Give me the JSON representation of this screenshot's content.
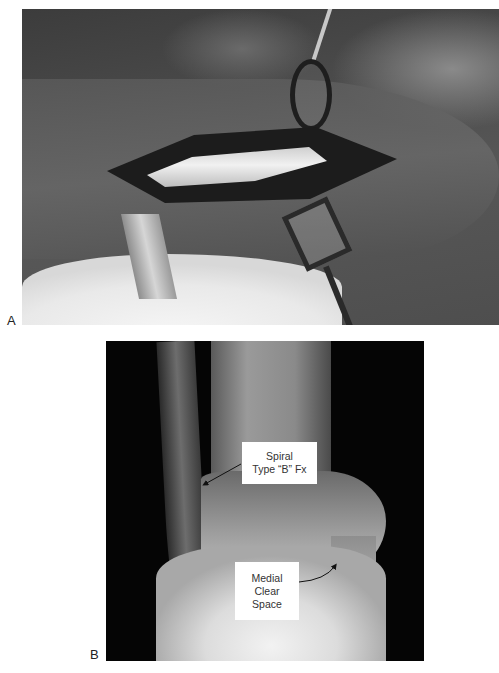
{
  "figure": {
    "panels": [
      {
        "id": "A",
        "label": "A",
        "type": "intraoperative-photograph",
        "description": "Surgical exposure of lateral ankle with retractors"
      },
      {
        "id": "B",
        "label": "B",
        "type": "radiograph",
        "description": "AP ankle radiograph",
        "annotations": [
          {
            "id": "spiral",
            "lines": [
              "Spiral",
              "Type “B” Fx"
            ]
          },
          {
            "id": "medial",
            "lines": [
              "Medial",
              "Clear",
              "Space"
            ]
          }
        ]
      }
    ]
  }
}
